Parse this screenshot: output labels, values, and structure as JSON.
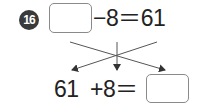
{
  "problem": {
    "number": "16",
    "top_equation": {
      "blank": "",
      "operator_text": "−8＝61"
    },
    "bottom_equation": {
      "left_number": "61",
      "operator_text": "+8＝",
      "blank": ""
    },
    "arrows": [
      "crossed-line-left-arrow",
      "vertical-down-arrow",
      "crossed-line-right-arrow"
    ]
  },
  "colors": {
    "badge_bg": "#3a3a3a",
    "box_border": "#8a8a8a",
    "text": "#222222"
  }
}
